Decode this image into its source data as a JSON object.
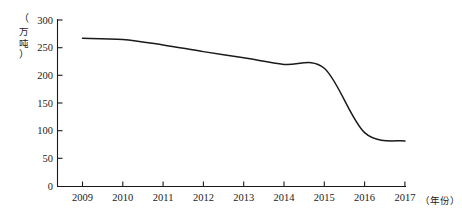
{
  "chart_data": {
    "type": "line",
    "title": "",
    "subtitle": "",
    "xlabel": "（年份）",
    "ylabel": "（万吨）",
    "ylabel_chars": [
      "（",
      "万",
      "吨",
      "）"
    ],
    "categories": [
      "2009",
      "2010",
      "2011",
      "2012",
      "2013",
      "2014",
      "2015",
      "2016",
      "2017"
    ],
    "x": [
      2009,
      2010,
      2011,
      2012,
      2013,
      2014,
      2015,
      2016,
      2017
    ],
    "values": [
      267,
      265,
      255,
      243,
      232,
      220,
      213,
      97,
      82
    ],
    "series": [
      {
        "name": "产量",
        "values": [
          267,
          265,
          255,
          243,
          232,
          220,
          213,
          97,
          82
        ]
      }
    ],
    "ylim": [
      0,
      300
    ],
    "xlim": [
      2009,
      2017
    ],
    "yticks": [
      0,
      50,
      100,
      150,
      200,
      250,
      300
    ],
    "ytick_labels": [
      "0",
      "50",
      "100",
      "150",
      "200",
      "250",
      "300"
    ],
    "xtick_labels": [
      "2009",
      "2010",
      "2011",
      "2012",
      "2013",
      "2014",
      "2015",
      "2016",
      "2017"
    ],
    "grid": false,
    "legend": false,
    "legend_position": "none",
    "line_color": "#1a1a1a",
    "axis_color": "#1a1a1a",
    "background_color": "#ffffff",
    "annotations": []
  },
  "axes": {
    "y_unit_label": "（万吨）",
    "x_unit_label": "（年份）"
  }
}
